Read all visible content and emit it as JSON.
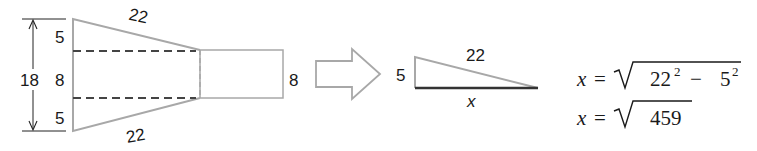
{
  "figure": {
    "left_shape": {
      "total_height_label": "18",
      "top_segment_label": "5",
      "middle_segment_label": "8",
      "bottom_segment_label": "5",
      "top_slant_label": "22",
      "bottom_slant_label": "22",
      "rect_height_label": "8"
    },
    "arrow": {
      "direction": "right"
    },
    "triangle": {
      "leg_label": "5",
      "hypotenuse_label": "22",
      "base_label": "x"
    },
    "equations": {
      "line1": {
        "lhs": "x",
        "eq": "=",
        "a": "22",
        "a_exp": "2",
        "op": "−",
        "b": "5",
        "b_exp": "2"
      },
      "line2": {
        "lhs": "x",
        "eq": "=",
        "radicand": "459"
      }
    },
    "colors": {
      "outline": "#a8a8a8",
      "dashed": "#444444",
      "base_line": "#333333",
      "text": "#1a1a1a"
    }
  }
}
